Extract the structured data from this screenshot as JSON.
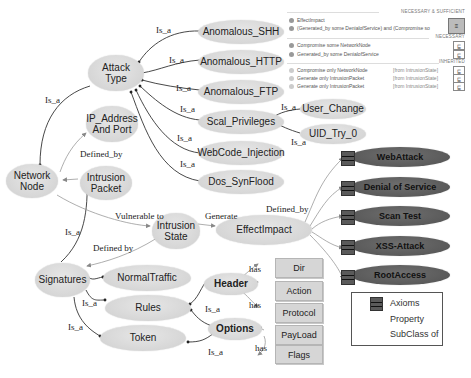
{
  "diagram": {
    "type": "ontology",
    "nodes": {
      "attack_type": "Attack\nType",
      "network_node": "Network\nNode",
      "ip_address": "IP_Address\nAnd Port",
      "intrusion_packet": "Intrusion\nPacket",
      "intrusion_state": "Intrusion\nState",
      "effect_impact": "EffectImpact",
      "signatures": "Signatures",
      "normal_traffic": "NormalTraffic",
      "rules": "Rules",
      "token": "Token",
      "header": "Header",
      "options": "Options",
      "anomalous_shh": "Anomalous_SHH",
      "anomalous_http": "Anomalous_HTTP",
      "anomalous_ftp": "Anomalous_FTP",
      "scal_privileges": "Scal_Privileges",
      "webcode_injection": "WebCode_Injection",
      "dos_synflood": "Dos_SynFlood",
      "user_change": "User_Change",
      "uid_try": "UID_Try_0",
      "dir": "Dir",
      "action": "Action",
      "protocol": "Protocol",
      "payload": "PayLoad",
      "flags": "Flags",
      "web_attack": "WebAttack",
      "denial_of_service": "Denial of Service",
      "scan_test": "Scan Test",
      "xss_attack": "XSS-Attack",
      "root_access": "RootAccess"
    },
    "edge_labels": {
      "is_a": "Is_a",
      "defined_by": "Defined_by",
      "defined_by_space": "Defined by",
      "vulnerable_to": "Vulnerable to",
      "generate": "Generate",
      "has": "has"
    }
  },
  "axiom_panel": {
    "header_necessary_sufficient": "NECESSARY & SUFFICIENT",
    "header_necessary": "NECESSARY",
    "header_inherited": "INHERITED",
    "ns_rows": [
      "EffectImpact",
      "(Generated_by some DenialofService) and (Compromise so"
    ],
    "necessary_rows": [
      "Compromise some NetworkNode",
      "Generated_by some DenialofService"
    ],
    "inherited_rows": [
      "Compromise only NetworkNode",
      "Generate only IntrusionPacket",
      "Generate only IntrusionPacket"
    ],
    "inherited_source": "[from IntrusionState]",
    "eq_symbol": "≡",
    "sub_symbol": "⊑"
  },
  "legend": {
    "axioms": "Axioms",
    "property": "Property",
    "subclass_of": "SubClass of"
  }
}
